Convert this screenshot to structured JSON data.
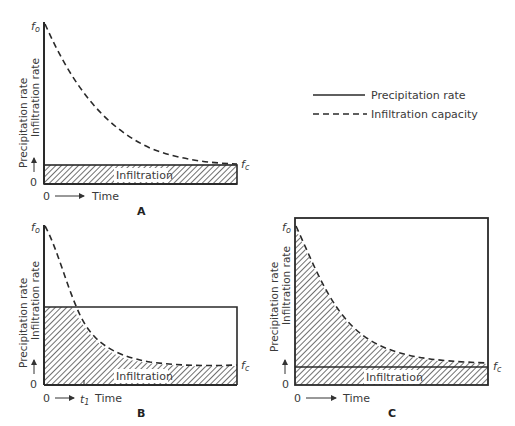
{
  "legend": {
    "precipitation_label": "Precipitation rate",
    "infiltration_label": "Infiltration capacity"
  },
  "axis": {
    "y_label_line1": "Precipitation rate",
    "y_label_line2": "Infiltration rate",
    "x_label": "Time",
    "origin_y": "0",
    "origin_x": "0",
    "f_o": "f",
    "f_o_sub": "o",
    "f_c": "f",
    "f_c_sub": "c",
    "t1": "t",
    "t1_sub": "1"
  },
  "panels": {
    "A": {
      "letter": "A",
      "region_label": "Infiltration"
    },
    "B": {
      "letter": "B",
      "region_label": "Infiltration"
    },
    "C": {
      "letter": "C",
      "region_label": "Infiltration"
    }
  },
  "colors": {
    "line": "#2a2a2a",
    "hatch": "#333333",
    "text": "#3a3a3a"
  }
}
